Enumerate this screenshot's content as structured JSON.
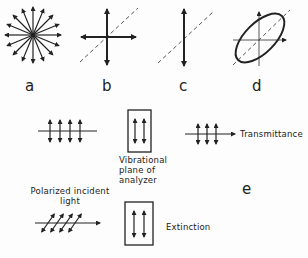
{
  "figure": {
    "panels": [
      {
        "id": "a",
        "label": "a",
        "description": "unpolarized light: vibrations in all directions"
      },
      {
        "id": "b",
        "label": "b",
        "description": "two perpendicular vibration directions"
      },
      {
        "id": "c",
        "label": "c",
        "description": "plane-polarized: single vibration direction"
      },
      {
        "id": "d",
        "label": "d",
        "description": "elliptically polarized light"
      }
    ],
    "panel_e": {
      "label": "e",
      "analyzer_label": "Vibrational plane of analyzer",
      "analyzer_lines": [
        "Vibrational",
        "plane of",
        "analyzer"
      ],
      "incident_label_lines": [
        "Polarized incident",
        "light"
      ],
      "transmittance_label": "Transmittance",
      "extinction_label": "Extinction"
    },
    "colors": {
      "ink": "#222222",
      "dashed": "#555555",
      "background": "#fdfdfd"
    }
  }
}
